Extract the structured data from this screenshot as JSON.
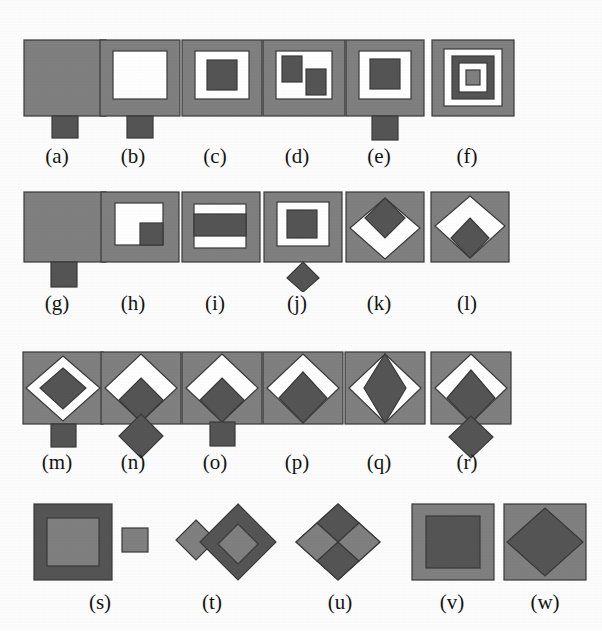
{
  "figure": {
    "background_color": "#fdfdfd",
    "palette": {
      "gray": "#808080",
      "dark": "#555555",
      "white": "#ffffff",
      "outline": "#3a3a3a",
      "label_color": "#141414"
    },
    "label_font_size_px": 21,
    "rows": [
      {
        "label_y": 146,
        "items": [
          "a",
          "b",
          "c",
          "d",
          "e",
          "f"
        ]
      },
      {
        "label_y": 293,
        "items": [
          "g",
          "h",
          "i",
          "j",
          "k",
          "l"
        ]
      },
      {
        "label_y": 452,
        "items": [
          "m",
          "n",
          "o",
          "p",
          "q",
          "r"
        ]
      },
      {
        "label_y": 592,
        "items": [
          "s",
          "t",
          "u",
          "v",
          "w"
        ]
      }
    ],
    "items": [
      {
        "id": "a",
        "label": "(a)",
        "label_cx": 57,
        "cell_x": 18,
        "cell_y": 32,
        "w": 96,
        "h": 112,
        "description": "filled gray square with small dark square tab below",
        "parts": [
          {
            "kind": "rect",
            "x": 6,
            "y": 8,
            "w": 82,
            "h": 76,
            "fill": "gray"
          },
          {
            "kind": "rect",
            "x": 34,
            "y": 84,
            "w": 26,
            "h": 22,
            "fill": "dark"
          }
        ]
      },
      {
        "id": "b",
        "label": "(b)",
        "label_cx": 133,
        "cell_x": 94,
        "cell_y": 32,
        "w": 96,
        "h": 112,
        "description": "gray square frame with white hole and small dark square tab below",
        "parts": [
          {
            "kind": "rect",
            "x": 6,
            "y": 8,
            "w": 80,
            "h": 76,
            "fill": "gray"
          },
          {
            "kind": "rect",
            "x": 19,
            "y": 19,
            "w": 54,
            "h": 48,
            "fill": "white"
          },
          {
            "kind": "rect",
            "x": 33,
            "y": 84,
            "w": 26,
            "h": 22,
            "fill": "dark"
          }
        ]
      },
      {
        "id": "c",
        "label": "(c)",
        "label_cx": 215,
        "cell_x": 177,
        "cell_y": 32,
        "w": 90,
        "h": 92,
        "description": "gray frame, white ring, dark square centre",
        "parts": [
          {
            "kind": "rect",
            "x": 5,
            "y": 8,
            "w": 80,
            "h": 76,
            "fill": "gray"
          },
          {
            "kind": "rect",
            "x": 18,
            "y": 19,
            "w": 54,
            "h": 48,
            "fill": "white"
          },
          {
            "kind": "rect",
            "x": 30,
            "y": 28,
            "w": 30,
            "h": 30,
            "fill": "dark"
          }
        ]
      },
      {
        "id": "d",
        "label": "(d)",
        "label_cx": 297,
        "cell_x": 258,
        "cell_y": 32,
        "w": 92,
        "h": 92,
        "description": "gray frame, white hole containing two dark rectangles offset diagonally",
        "parts": [
          {
            "kind": "rect",
            "x": 5,
            "y": 8,
            "w": 82,
            "h": 76,
            "fill": "gray"
          },
          {
            "kind": "rect",
            "x": 18,
            "y": 19,
            "w": 56,
            "h": 48,
            "fill": "white"
          },
          {
            "kind": "rect",
            "x": 24,
            "y": 24,
            "w": 20,
            "h": 26,
            "fill": "dark"
          },
          {
            "kind": "rect",
            "x": 48,
            "y": 37,
            "w": 20,
            "h": 26,
            "fill": "dark"
          }
        ]
      },
      {
        "id": "e",
        "label": "(e)",
        "label_cx": 379,
        "cell_x": 340,
        "cell_y": 32,
        "w": 92,
        "h": 112,
        "description": "gray frame, white ring, dark square centre, dark square tab below",
        "parts": [
          {
            "kind": "rect",
            "x": 6,
            "y": 8,
            "w": 78,
            "h": 76,
            "fill": "gray"
          },
          {
            "kind": "rect",
            "x": 19,
            "y": 19,
            "w": 52,
            "h": 48,
            "fill": "white"
          },
          {
            "kind": "rect",
            "x": 30,
            "y": 27,
            "w": 30,
            "h": 30,
            "fill": "dark"
          },
          {
            "kind": "rect",
            "x": 32,
            "y": 84,
            "w": 26,
            "h": 24,
            "fill": "dark"
          }
        ]
      },
      {
        "id": "f",
        "label": "(f)",
        "label_cx": 467,
        "cell_x": 425,
        "cell_y": 32,
        "w": 96,
        "h": 92,
        "description": "concentric squares gray-white-dark-white-gray",
        "parts": [
          {
            "kind": "rect",
            "x": 7,
            "y": 8,
            "w": 82,
            "h": 76,
            "fill": "gray"
          },
          {
            "kind": "rect",
            "x": 19,
            "y": 17,
            "w": 58,
            "h": 57,
            "fill": "white"
          },
          {
            "kind": "rect",
            "x": 27,
            "y": 24,
            "w": 42,
            "h": 43,
            "fill": "dark"
          },
          {
            "kind": "rect",
            "x": 34,
            "y": 31,
            "w": 28,
            "h": 29,
            "fill": "white"
          },
          {
            "kind": "rect",
            "x": 41,
            "y": 38,
            "w": 14,
            "h": 15,
            "fill": "gray"
          }
        ]
      },
      {
        "id": "g",
        "label": "(g)",
        "label_cx": 57,
        "cell_x": 18,
        "cell_y": 188,
        "w": 96,
        "h": 100,
        "description": "filled gray square with wide dark tab below",
        "parts": [
          {
            "kind": "rect",
            "x": 6,
            "y": 4,
            "w": 82,
            "h": 70,
            "fill": "gray"
          },
          {
            "kind": "rect",
            "x": 33,
            "y": 74,
            "w": 26,
            "h": 25,
            "fill": "dark"
          }
        ]
      },
      {
        "id": "h",
        "label": "(h)",
        "label_cx": 133,
        "cell_x": 97,
        "cell_y": 188,
        "w": 86,
        "h": 80,
        "description": "gray frame with white L-shaped hole and dark square in lower-right corner",
        "parts": [
          {
            "kind": "rect",
            "x": 4,
            "y": 4,
            "w": 78,
            "h": 70,
            "fill": "gray"
          },
          {
            "kind": "rect",
            "x": 18,
            "y": 15,
            "w": 48,
            "h": 42,
            "fill": "white"
          },
          {
            "kind": "rect",
            "x": 43,
            "y": 35,
            "w": 23,
            "h": 22,
            "fill": "dark"
          }
        ]
      },
      {
        "id": "i",
        "label": "(i)",
        "label_cx": 215,
        "cell_x": 178,
        "cell_y": 188,
        "w": 86,
        "h": 80,
        "description": "gray frame with horizontal white-dark-white bands",
        "parts": [
          {
            "kind": "rect",
            "x": 4,
            "y": 4,
            "w": 78,
            "h": 70,
            "fill": "gray"
          },
          {
            "kind": "rect",
            "x": 16,
            "y": 16,
            "w": 52,
            "h": 44,
            "fill": "white"
          },
          {
            "kind": "rect",
            "x": 16,
            "y": 26,
            "w": 52,
            "h": 22,
            "fill": "dark"
          }
        ]
      },
      {
        "id": "j",
        "label": "(j)",
        "label_cx": 297,
        "cell_x": 258,
        "cell_y": 188,
        "w": 90,
        "h": 104,
        "description": "gray frame, white ring, dark square centre, dark diamond tab below",
        "parts": [
          {
            "kind": "rect",
            "x": 6,
            "y": 4,
            "w": 78,
            "h": 70,
            "fill": "gray"
          },
          {
            "kind": "rect",
            "x": 19,
            "y": 14,
            "w": 52,
            "h": 44,
            "fill": "white"
          },
          {
            "kind": "rect",
            "x": 29,
            "y": 22,
            "w": 30,
            "h": 28,
            "fill": "dark"
          },
          {
            "kind": "poly",
            "points": "45,74 61,90 45,104 29,90",
            "fill": "dark"
          }
        ]
      },
      {
        "id": "k",
        "label": "(k)",
        "label_cx": 379,
        "cell_x": 342,
        "cell_y": 188,
        "w": 86,
        "h": 80,
        "description": "gray square containing white diamond with dark diamond occupying its top half",
        "parts": [
          {
            "kind": "rect",
            "x": 4,
            "y": 4,
            "w": 78,
            "h": 70,
            "fill": "gray"
          },
          {
            "kind": "poly",
            "points": "43,10 78,40 43,71 8,40",
            "fill": "white"
          },
          {
            "kind": "poly",
            "points": "43,10 63,30 43,50 23,30",
            "fill": "dark"
          }
        ]
      },
      {
        "id": "l",
        "label": "(l)",
        "label_cx": 467,
        "cell_x": 427,
        "cell_y": 188,
        "w": 86,
        "h": 80,
        "description": "gray square containing white diamond with dark diamond occupying its bottom half",
        "parts": [
          {
            "kind": "rect",
            "x": 4,
            "y": 4,
            "w": 78,
            "h": 70,
            "fill": "gray"
          },
          {
            "kind": "poly",
            "points": "43,8 78,38 43,70 8,38",
            "fill": "white"
          },
          {
            "kind": "poly",
            "points": "43,30 62,50 43,70 24,50",
            "fill": "dark"
          }
        ]
      },
      {
        "id": "m",
        "label": "(m)",
        "label_cx": 57,
        "cell_x": 18,
        "cell_y": 348,
        "w": 96,
        "h": 104,
        "description": "gray square, white diamond ring, dark diamond centre, dark square tab below",
        "parts": [
          {
            "kind": "rect",
            "x": 5,
            "y": 4,
            "w": 80,
            "h": 72,
            "fill": "gray"
          },
          {
            "kind": "poly",
            "points": "45,8 82,40 45,73 8,40",
            "fill": "white"
          },
          {
            "kind": "poly",
            "points": "45,20 68,40 45,61 22,40",
            "fill": "dark"
          },
          {
            "kind": "rect",
            "x": 33,
            "y": 76,
            "w": 25,
            "h": 23,
            "fill": "dark"
          }
        ]
      },
      {
        "id": "n",
        "label": "(n)",
        "label_cx": 133,
        "cell_x": 97,
        "cell_y": 348,
        "w": 96,
        "h": 112,
        "description": "gray square, white diamond upper, dark diamond lower inside, external dark diamond below",
        "parts": [
          {
            "kind": "rect",
            "x": 4,
            "y": 4,
            "w": 80,
            "h": 72,
            "fill": "gray"
          },
          {
            "kind": "poly",
            "points": "44,6 80,40 44,74 8,40",
            "fill": "white"
          },
          {
            "kind": "poly",
            "points": "44,30 66,52 44,74 22,52",
            "fill": "dark"
          },
          {
            "kind": "poly",
            "points": "44,66 66,88 44,110 22,88",
            "fill": "dark"
          }
        ]
      },
      {
        "id": "o",
        "label": "(o)",
        "label_cx": 215,
        "cell_x": 178,
        "cell_y": 348,
        "w": 96,
        "h": 104,
        "description": "gray square, white diamond upper, dark diamond lower inside, dark square tab below",
        "parts": [
          {
            "kind": "rect",
            "x": 4,
            "y": 4,
            "w": 80,
            "h": 72,
            "fill": "gray"
          },
          {
            "kind": "poly",
            "points": "44,6 80,40 44,74 8,40",
            "fill": "white"
          },
          {
            "kind": "poly",
            "points": "44,30 66,52 44,74 22,52",
            "fill": "dark"
          },
          {
            "kind": "rect",
            "x": 32,
            "y": 74,
            "w": 25,
            "h": 24,
            "fill": "dark"
          }
        ]
      },
      {
        "id": "p",
        "label": "(p)",
        "label_cx": 297,
        "cell_x": 258,
        "cell_y": 348,
        "w": 92,
        "h": 84,
        "description": "gray square, white diamond ring open at bottom, dark diamond centre touching bottom vertex",
        "parts": [
          {
            "kind": "rect",
            "x": 5,
            "y": 4,
            "w": 80,
            "h": 72,
            "fill": "gray"
          },
          {
            "kind": "poly",
            "points": "45,6 81,40 45,75 9,40",
            "fill": "white"
          },
          {
            "kind": "poly",
            "points": "45,24 69,50 45,75 21,50",
            "fill": "dark"
          }
        ]
      },
      {
        "id": "q",
        "label": "(q)",
        "label_cx": 379,
        "cell_x": 340,
        "cell_y": 348,
        "w": 92,
        "h": 84,
        "description": "gray square, tall dark diamond with thin white crescents left and right",
        "parts": [
          {
            "kind": "rect",
            "x": 5,
            "y": 4,
            "w": 80,
            "h": 72,
            "fill": "gray"
          },
          {
            "kind": "poly",
            "points": "45,6 81,40 45,75 9,40",
            "fill": "white"
          },
          {
            "kind": "poly",
            "points": "45,6 66,40 45,75 24,40",
            "fill": "dark"
          }
        ]
      },
      {
        "id": "r",
        "label": "(r)",
        "label_cx": 467,
        "cell_x": 425,
        "cell_y": 348,
        "w": 96,
        "h": 112,
        "description": "gray square, white diamond ring, dark diamond centre, external dark diamond below",
        "parts": [
          {
            "kind": "rect",
            "x": 6,
            "y": 4,
            "w": 80,
            "h": 72,
            "fill": "gray"
          },
          {
            "kind": "poly",
            "points": "46,6 82,40 46,75 10,40",
            "fill": "white"
          },
          {
            "kind": "poly",
            "points": "46,22 70,50 46,75 22,50",
            "fill": "dark"
          },
          {
            "kind": "poly",
            "points": "46,68 68,89 46,110 24,89",
            "fill": "dark"
          }
        ]
      },
      {
        "id": "s",
        "label": "(s)",
        "label_cx": 100,
        "cell_x": 28,
        "cell_y": 500,
        "w": 140,
        "h": 86,
        "description": "dark square frame with light gray centre, plus detached small light gray square to the right",
        "parts": [
          {
            "kind": "rect",
            "x": 6,
            "y": 4,
            "w": 78,
            "h": 76,
            "fill": "dark"
          },
          {
            "kind": "rect",
            "x": 19,
            "y": 18,
            "w": 52,
            "h": 48,
            "fill": "gray"
          },
          {
            "kind": "rect",
            "x": 94,
            "y": 28,
            "w": 26,
            "h": 24,
            "fill": "gray"
          }
        ]
      },
      {
        "id": "t",
        "label": "(t)",
        "label_cx": 212,
        "cell_x": 172,
        "cell_y": 500,
        "w": 108,
        "h": 86,
        "description": "small gray diamond overlapping a large dark diamond that holds a gray diamond centre",
        "parts": [
          {
            "kind": "poly",
            "points": "24,20 44,40 24,60 4,40",
            "fill": "gray"
          },
          {
            "kind": "poly",
            "points": "66,4 104,42 66,80 28,42",
            "fill": "dark"
          },
          {
            "kind": "poly",
            "points": "66,24 86,44 66,64 46,44",
            "fill": "gray"
          }
        ]
      },
      {
        "id": "u",
        "label": "(u)",
        "label_cx": 340,
        "cell_x": 292,
        "cell_y": 500,
        "w": 96,
        "h": 86,
        "description": "diamond divided into four alternating dark and gray quadrants",
        "parts": [
          {
            "kind": "poly",
            "points": "46,4 88,42 46,80 4,42",
            "fill": "gray"
          },
          {
            "kind": "poly",
            "points": "46,4 67,23 46,42 25,23",
            "fill": "dark"
          },
          {
            "kind": "poly",
            "points": "46,42 67,61 46,80 25,61",
            "fill": "dark"
          },
          {
            "kind": "poly",
            "points": "25,23 46,42 25,61 4,42",
            "fill": "gray"
          },
          {
            "kind": "poly",
            "points": "67,23 88,42 67,61 46,42",
            "fill": "gray"
          }
        ]
      },
      {
        "id": "v",
        "label": "(v)",
        "label_cx": 452,
        "cell_x": 408,
        "cell_y": 500,
        "w": 90,
        "h": 86,
        "description": "gray square frame with large dark square centre",
        "parts": [
          {
            "kind": "rect",
            "x": 4,
            "y": 4,
            "w": 82,
            "h": 76,
            "fill": "gray"
          },
          {
            "kind": "rect",
            "x": 18,
            "y": 16,
            "w": 54,
            "h": 52,
            "fill": "dark"
          }
        ]
      },
      {
        "id": "w",
        "label": "(w)",
        "label_cx": 545,
        "cell_x": 500,
        "cell_y": 500,
        "w": 90,
        "h": 86,
        "description": "gray square frame with large dark diamond centre",
        "parts": [
          {
            "kind": "rect",
            "x": 4,
            "y": 4,
            "w": 82,
            "h": 76,
            "fill": "gray"
          },
          {
            "kind": "poly",
            "points": "45,8 83,42 45,76 7,42",
            "fill": "dark"
          }
        ]
      }
    ]
  }
}
